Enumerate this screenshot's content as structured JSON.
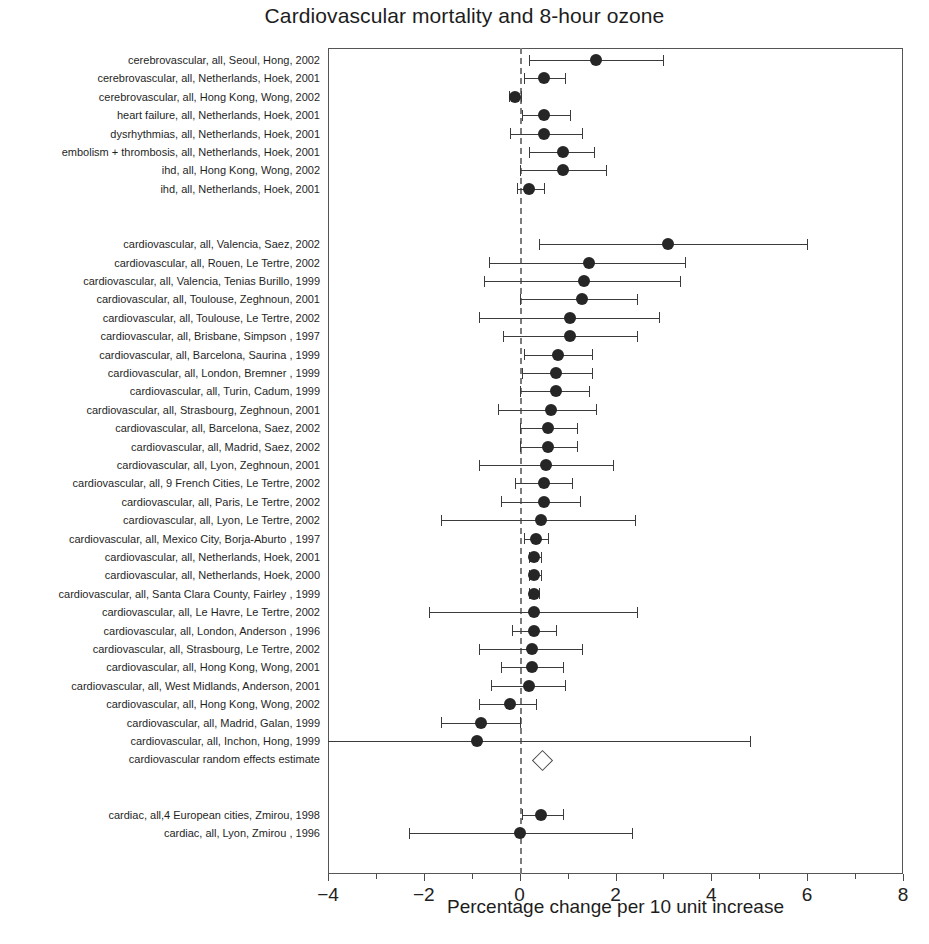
{
  "chart_data": {
    "type": "scatter",
    "subtype": "forest-plot",
    "title": "Cardiovascular mortality and 8-hour ozone",
    "xlabel": "Percentage change per 10 unit increase",
    "ylabel": "",
    "xlim": [
      -4,
      8
    ],
    "xticks": [
      -4,
      -2,
      0,
      2,
      4,
      6,
      8
    ],
    "xtick_labels": [
      "−4",
      "−2",
      "0",
      "2",
      "4",
      "6",
      "8"
    ],
    "grid": false,
    "legend": "none",
    "reference_line": 0,
    "reference_line_style": "dashed",
    "point_marker": "filled-circle",
    "summary_marker": "open-diamond",
    "rows": [
      {
        "label": "cerebrovascular, all, Seoul, Hong, 2002",
        "estimate": 1.6,
        "low": 0.2,
        "high": 3.0,
        "marker": "circle"
      },
      {
        "label": "cerebrovascular, all, Netherlands, Hoek, 2001",
        "estimate": 0.5,
        "low": 0.1,
        "high": 0.95,
        "marker": "circle"
      },
      {
        "label": "cerebrovascular, all, Hong Kong, Wong, 2002",
        "estimate": -0.1,
        "low": -0.22,
        "high": 0.02,
        "marker": "circle"
      },
      {
        "label": "heart failure, all, Netherlands, Hoek, 2001",
        "estimate": 0.5,
        "low": 0.05,
        "high": 1.05,
        "marker": "circle"
      },
      {
        "label": "dysrhythmias, all, Netherlands, Hoek, 2001",
        "estimate": 0.5,
        "low": -0.2,
        "high": 1.3,
        "marker": "circle"
      },
      {
        "label": "embolism + thrombosis, all, Netherlands, Hoek, 2001",
        "estimate": 0.9,
        "low": 0.2,
        "high": 1.55,
        "marker": "circle"
      },
      {
        "label": "ihd, all, Hong Kong, Wong, 2002",
        "estimate": 0.9,
        "low": 0.0,
        "high": 1.8,
        "marker": "circle"
      },
      {
        "label": "ihd, all, Netherlands, Hoek, 2001",
        "estimate": 0.2,
        "low": -0.05,
        "high": 0.5,
        "marker": "circle"
      },
      {
        "label": "cardiovascular, all, Valencia, Saez, 2002",
        "estimate": 3.1,
        "low": 0.4,
        "high": 6.0,
        "marker": "circle"
      },
      {
        "label": "cardiovascular, all, Rouen, Le Tertre, 2002",
        "estimate": 1.45,
        "low": -0.65,
        "high": 3.45,
        "marker": "circle"
      },
      {
        "label": "cardiovascular, all, Valencia, Tenias Burillo, 1999",
        "estimate": 1.35,
        "low": -0.75,
        "high": 3.35,
        "marker": "circle"
      },
      {
        "label": "cardiovascular, all, Toulouse, Zeghnoun, 2001",
        "estimate": 1.3,
        "low": 0.0,
        "high": 2.45,
        "marker": "circle"
      },
      {
        "label": "cardiovascular, all, Toulouse, Le Tertre, 2002",
        "estimate": 1.05,
        "low": -0.85,
        "high": 2.9,
        "marker": "circle"
      },
      {
        "label": "cardiovascular, all, Brisbane, Simpson , 1997",
        "estimate": 1.05,
        "low": -0.35,
        "high": 2.45,
        "marker": "circle"
      },
      {
        "label": "cardiovascular, all, Barcelona, Saurina , 1999",
        "estimate": 0.8,
        "low": 0.1,
        "high": 1.5,
        "marker": "circle"
      },
      {
        "label": "cardiovascular, all, London, Bremner , 1999",
        "estimate": 0.75,
        "low": 0.05,
        "high": 1.5,
        "marker": "circle"
      },
      {
        "label": "cardiovascular, all, Turin, Cadum, 1999",
        "estimate": 0.75,
        "low": 0.0,
        "high": 1.45,
        "marker": "circle"
      },
      {
        "label": "cardiovascular, all, Strasbourg, Zeghnoun, 2001",
        "estimate": 0.65,
        "low": -0.45,
        "high": 1.6,
        "marker": "circle"
      },
      {
        "label": "cardiovascular, all, Barcelona, Saez, 2002",
        "estimate": 0.6,
        "low": 0.0,
        "high": 1.2,
        "marker": "circle"
      },
      {
        "label": "cardiovascular, all, Madrid, Saez, 2002",
        "estimate": 0.6,
        "low": 0.0,
        "high": 1.2,
        "marker": "circle"
      },
      {
        "label": "cardiovascular, all, Lyon, Zeghnoun, 2001",
        "estimate": 0.55,
        "low": -0.85,
        "high": 1.95,
        "marker": "circle"
      },
      {
        "label": "cardiovascular, all, 9 French Cities, Le Tertre, 2002",
        "estimate": 0.5,
        "low": -0.1,
        "high": 1.1,
        "marker": "circle"
      },
      {
        "label": "cardiovascular, all, Paris, Le Tertre, 2002",
        "estimate": 0.5,
        "low": -0.4,
        "high": 1.25,
        "marker": "circle"
      },
      {
        "label": "cardiovascular, all, Lyon, Le Tertre, 2002",
        "estimate": 0.45,
        "low": -1.65,
        "high": 2.4,
        "marker": "circle"
      },
      {
        "label": "cardiovascular, all, Mexico City, Borja-Aburto , 1997",
        "estimate": 0.35,
        "low": 0.1,
        "high": 0.6,
        "marker": "circle"
      },
      {
        "label": "cardiovascular, all, Netherlands, Hoek, 2001",
        "estimate": 0.3,
        "low": 0.2,
        "high": 0.45,
        "marker": "circle"
      },
      {
        "label": "cardiovascular, all, Netherlands, Hoek, 2000",
        "estimate": 0.3,
        "low": 0.2,
        "high": 0.45,
        "marker": "circle"
      },
      {
        "label": "cardiovascular, all, Santa Clara County, Fairley , 1999",
        "estimate": 0.3,
        "low": 0.2,
        "high": 0.4,
        "marker": "circle"
      },
      {
        "label": "cardiovascular, all, Le Havre, Le Tertre, 2002",
        "estimate": 0.3,
        "low": -1.9,
        "high": 2.45,
        "marker": "circle"
      },
      {
        "label": "cardiovascular, all, London, Anderson , 1996",
        "estimate": 0.3,
        "low": -0.15,
        "high": 0.75,
        "marker": "circle"
      },
      {
        "label": "cardiovascular, all, Strasbourg, Le Tertre, 2002",
        "estimate": 0.25,
        "low": -0.85,
        "high": 1.3,
        "marker": "circle"
      },
      {
        "label": "cardiovascular, all, Hong Kong, Wong, 2001",
        "estimate": 0.25,
        "low": -0.4,
        "high": 0.9,
        "marker": "circle"
      },
      {
        "label": "cardiovascular, all, West Midlands, Anderson, 2001",
        "estimate": 0.2,
        "low": -0.6,
        "high": 0.95,
        "marker": "circle"
      },
      {
        "label": "cardiovascular, all, Hong Kong, Wong, 2002",
        "estimate": -0.2,
        "low": -0.85,
        "high": 0.35,
        "marker": "circle"
      },
      {
        "label": "cardiovascular, all, Madrid, Galan, 1999",
        "estimate": -0.8,
        "low": -1.65,
        "high": 0.0,
        "marker": "circle"
      },
      {
        "label": "cardiovascular, all, Inchon, Hong, 1999",
        "estimate": -0.9,
        "low": -4.0,
        "high": 4.8,
        "marker": "circle"
      },
      {
        "label": "cardiovascular random effects estimate",
        "estimate": 0.45,
        "low": 0.3,
        "high": 0.6,
        "marker": "diamond"
      },
      {
        "label": "cardiac, all,4 European cities, Zmirou, 1998",
        "estimate": 0.45,
        "low": 0.05,
        "high": 0.9,
        "marker": "circle"
      },
      {
        "label": "cardiac, all, Lyon, Zmirou , 1996",
        "estimate": 0.0,
        "low": -2.3,
        "high": 2.35,
        "marker": "circle"
      }
    ]
  },
  "colors": {
    "marker": "#262626",
    "line": "#3b3b3b",
    "frame": "#555555",
    "zero_line": "#7c7c7c",
    "text": "#1d1d1d"
  }
}
